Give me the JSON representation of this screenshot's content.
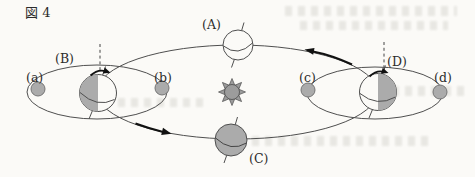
{
  "figure": {
    "title": "図 4",
    "type": "sun-earth-moon orbital diagram",
    "orbit_direction": "counterclockwise (arrows point from D toward A at top, and from B toward C at bottom)",
    "sun": {
      "name": "sun",
      "location": "center of orbit"
    },
    "earth_positions": [
      {
        "id": "A",
        "label": "(A)",
        "location": "top of orbit",
        "shading": "unshaded white globe with tilted axis and equator line"
      },
      {
        "id": "B",
        "label": "(B)",
        "location": "left of orbit",
        "shading": "left half shaded; dashed vertical line and rotation arrow above; moon orbit ellipse around it"
      },
      {
        "id": "C",
        "label": "(C)",
        "location": "bottom of orbit",
        "shading": "fully shaded globe with tilted axis and equator line"
      },
      {
        "id": "D",
        "label": "(D)",
        "location": "right of orbit",
        "shading": "right half shaded; dashed vertical line and rotation arrow above; moon orbit ellipse around it"
      }
    ],
    "moon_positions": [
      {
        "id": "a",
        "label": "(a)",
        "location": "left end of moon orbit around earth B"
      },
      {
        "id": "b",
        "label": "(b)",
        "location": "right end of moon orbit around earth B"
      },
      {
        "id": "c",
        "label": "(c)",
        "location": "left end of moon orbit around earth D"
      },
      {
        "id": "d",
        "label": "(d)",
        "location": "right end of moon orbit around earth D"
      }
    ]
  },
  "colors": {
    "background": "#fbfaf7",
    "line": "#4f4f4f",
    "body_fill": "#ababab",
    "sun_fill": "#9c9c9c",
    "arrow": "#111111"
  }
}
